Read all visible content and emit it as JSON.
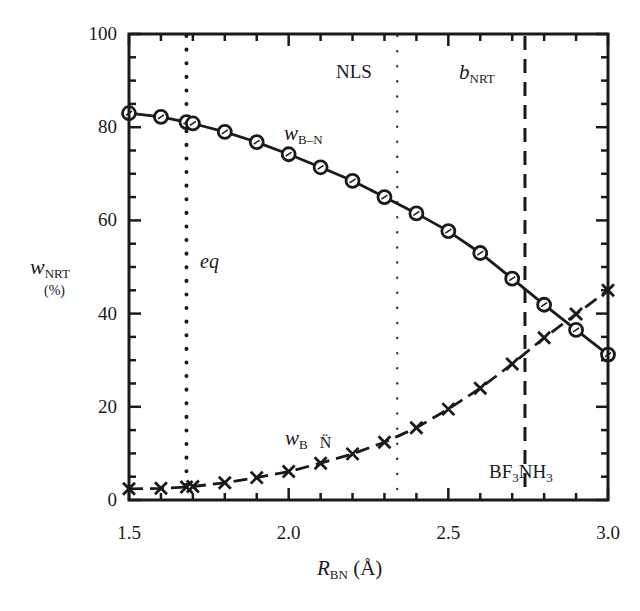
{
  "chart_data": {
    "type": "line",
    "title": "",
    "xlabel": "R_BN (Å)",
    "ylabel": "w_NRT (%)",
    "xlim": [
      1.5,
      3.0
    ],
    "ylim": [
      0,
      100
    ],
    "x_ticks": [
      "1.5",
      "2.0",
      "2.5",
      "3.0"
    ],
    "y_ticks": [
      "0",
      "20",
      "40",
      "60",
      "80",
      "100"
    ],
    "grid": false,
    "legend": "none (inline labels)",
    "series": [
      {
        "name": "w_B–N",
        "marker": "circle",
        "line": "solid",
        "x": [
          1.5,
          1.6,
          1.68,
          1.7,
          1.8,
          1.9,
          2.0,
          2.1,
          2.2,
          2.3,
          2.4,
          2.5,
          2.6,
          2.7,
          2.8,
          2.9,
          3.0
        ],
        "values": [
          83.0,
          82.2,
          81.1,
          80.8,
          79.0,
          76.8,
          74.2,
          71.4,
          68.5,
          65.0,
          61.5,
          57.7,
          53.0,
          47.5,
          41.9,
          36.5,
          31.2
        ]
      },
      {
        "name": "w_B N̈",
        "marker": "x",
        "line": "dashed",
        "x": [
          1.5,
          1.6,
          1.68,
          1.7,
          1.8,
          1.9,
          2.0,
          2.1,
          2.2,
          2.3,
          2.4,
          2.5,
          2.6,
          2.7,
          2.8,
          2.9,
          3.0
        ],
        "values": [
          2.4,
          2.5,
          2.8,
          2.9,
          3.7,
          4.8,
          6.1,
          7.9,
          9.9,
          12.4,
          15.5,
          19.5,
          24.0,
          29.2,
          34.8,
          39.9,
          45.0
        ]
      }
    ],
    "reference_lines": [
      {
        "name": "eq",
        "x": 1.68,
        "style": "dotted-heavy"
      },
      {
        "name": "NLS",
        "x": 2.34,
        "style": "dotted-light"
      },
      {
        "name": "b_NRT",
        "x": 2.74,
        "style": "dashed"
      }
    ],
    "annotations": [
      "NLS",
      "b_NRT",
      "eq",
      "w_B–N",
      "w_B N̈",
      "BF3NH3"
    ]
  },
  "labels": {
    "y_title_main": "w",
    "y_title_sub": "NRT",
    "y_title_unit": "(%)",
    "x_title_main": "R",
    "x_title_sub": "BN",
    "x_title_unit": " (Å)",
    "nls": "NLS",
    "bnrt_main": "b",
    "bnrt_sub": "NRT",
    "eq": "eq",
    "wbn_main": "w",
    "wbn_sub": "B–N",
    "wbN_main": "w",
    "wbN_sub": "B",
    "wbN_N": "N̈",
    "bf3_a": "BF",
    "bf3_a_sub": "3",
    "bf3_b": "NH",
    "bf3_b_sub": "3"
  }
}
